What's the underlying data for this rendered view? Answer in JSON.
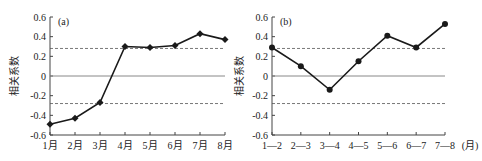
{
  "chart_data": [
    {
      "type": "line",
      "panel_label": "(a)",
      "title": "",
      "xlabel": "",
      "ylabel": "相关系数",
      "categories": [
        "1月",
        "2月",
        "3月",
        "4月",
        "5月",
        "6月",
        "7月",
        "8月"
      ],
      "values": [
        -0.49,
        -0.43,
        -0.27,
        0.3,
        0.29,
        0.31,
        0.43,
        0.37
      ],
      "ylim": [
        -0.6,
        0.6
      ],
      "yticks": [
        "0.6",
        "0.4",
        "0.2",
        "0",
        "-0.2",
        "-0.4",
        "-0.6"
      ],
      "reference_lines": [
        {
          "y": 0.28,
          "style": "dashed"
        },
        {
          "y": 0,
          "style": "solid"
        },
        {
          "y": -0.28,
          "style": "dashed"
        }
      ],
      "marker": "diamond",
      "grid": false
    },
    {
      "type": "line",
      "panel_label": "(b)",
      "title": "",
      "xlabel": "(月)",
      "ylabel": "相关系数",
      "categories": [
        "1—2",
        "2—3",
        "3—4",
        "4—5",
        "5—6",
        "6—7",
        "7—8"
      ],
      "values": [
        0.29,
        0.1,
        -0.14,
        0.15,
        0.41,
        0.29,
        0.53
      ],
      "ylim": [
        -0.6,
        0.6
      ],
      "yticks": [
        "0.6",
        "0.4",
        "0.2",
        "0",
        "-0.2",
        "-0.4",
        "-0.6"
      ],
      "reference_lines": [
        {
          "y": 0.28,
          "style": "dashed"
        },
        {
          "y": 0,
          "style": "solid"
        },
        {
          "y": -0.28,
          "style": "dashed"
        }
      ],
      "marker": "circle",
      "grid": false
    }
  ],
  "colors": {
    "line": "#1a1a1a",
    "axis": "#444444",
    "zero_line": "#888888",
    "dashed": "#555555"
  }
}
